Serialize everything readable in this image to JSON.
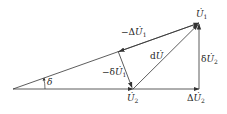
{
  "diagram": {
    "type": "phasor-diagram",
    "colors": {
      "line": "#333333",
      "background": "#ffffff"
    },
    "labels": {
      "U1": {
        "prefix": "",
        "symbol": "U̇",
        "sub": "1"
      },
      "U2": {
        "prefix": "",
        "symbol": "U̇",
        "sub": "2"
      },
      "negDeltaU1": {
        "prefix": "−Δ",
        "symbol": "U̇",
        "sub": "1"
      },
      "negdeltaU1": {
        "prefix": "−δ",
        "symbol": "U̇",
        "sub": "1"
      },
      "dU": {
        "prefix": "d",
        "symbol": "U̇",
        "sub": ""
      },
      "deltaU2": {
        "prefix": "δ",
        "symbol": "U̇",
        "sub": "2"
      },
      "DeltaU2": {
        "prefix": "Δ",
        "symbol": "U̇",
        "sub": "2"
      },
      "angle": {
        "prefix": "",
        "symbol": "δ",
        "sub": ""
      }
    },
    "points": {
      "O": [
        13,
        89
      ],
      "U2": [
        133,
        89
      ],
      "P": [
        199,
        89
      ],
      "U1": [
        199,
        23
      ],
      "F": [
        118,
        51
      ]
    }
  }
}
